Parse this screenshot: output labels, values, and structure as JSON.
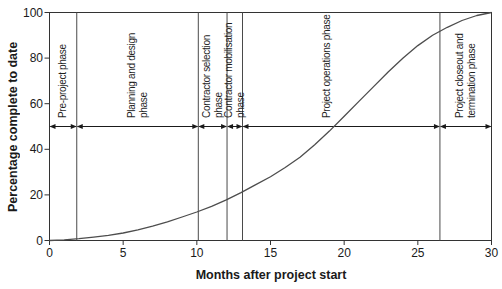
{
  "figure": {
    "background": "#ffffff"
  },
  "chart_data": {
    "type": "line",
    "title": "",
    "xlabel": "Months after project start",
    "ylabel": "Percentage complete to date",
    "xlim": [
      0,
      30
    ],
    "ylim": [
      0,
      100
    ],
    "xticks": [
      0,
      5,
      10,
      15,
      20,
      25,
      30
    ],
    "yticks": [
      0,
      20,
      40,
      60,
      80,
      100
    ],
    "grid": false,
    "frame": true,
    "legend": "none",
    "series": [
      {
        "name": "cumulative-progress-s-curve",
        "x": [
          0,
          1,
          2,
          3,
          4,
          5,
          6,
          7,
          8,
          9,
          10,
          11,
          12,
          13,
          14,
          15,
          16,
          17,
          18,
          19,
          20,
          21,
          22,
          23,
          24,
          25,
          26,
          27,
          28,
          29,
          30
        ],
        "y": [
          0,
          0.3,
          0.8,
          1.5,
          2.3,
          3.3,
          4.7,
          6.3,
          8.2,
          10.3,
          12.5,
          15.0,
          17.8,
          21.0,
          24.5,
          28.0,
          32.0,
          36.5,
          42.0,
          48.0,
          54.5,
          61.0,
          67.5,
          74.0,
          80.0,
          85.5,
          90.0,
          93.5,
          96.5,
          98.7,
          100
        ]
      }
    ],
    "phases": [
      {
        "label": "Pre-project phase",
        "lines": [
          "Pre-project phase"
        ],
        "start_month": 0,
        "end_month": 1.85
      },
      {
        "label": "Planning and design phase",
        "lines": [
          "Planning and design",
          "phase"
        ],
        "start_month": 1.85,
        "end_month": 10.1
      },
      {
        "label": "Contractor selection phase",
        "lines": [
          "Contractor selection",
          "phase"
        ],
        "start_month": 10.1,
        "end_month": 12.05
      },
      {
        "label": "Contractor mobilisation phase",
        "lines": [
          "Contractor mobilisation",
          "phase"
        ],
        "start_month": 12.05,
        "end_month": 13.1
      },
      {
        "label": "Project operations phase",
        "lines": [
          "Project operations phase"
        ],
        "start_month": 13.1,
        "end_month": 26.5,
        "label_month": 18.8
      },
      {
        "label": "Project closeout and termination phase",
        "lines": [
          "Project closeout and",
          "termination phase"
        ],
        "start_month": 26.5,
        "end_month": 30
      }
    ],
    "phase_arrow_y_percent": 50,
    "colors": {
      "curve": "#4d4d4d",
      "axis": "#333333",
      "phase_line": "#4a4a4a",
      "arrow": "#1a1a1a",
      "text": "#1a1a1a"
    }
  }
}
